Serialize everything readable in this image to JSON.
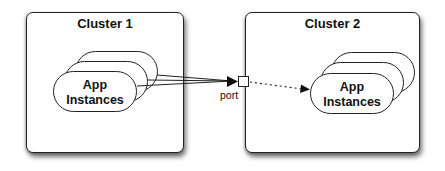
{
  "clusters": [
    {
      "title": "Cluster 1",
      "app_instances": {
        "line1": "App",
        "line2": "Instances",
        "stack_count": 3
      }
    },
    {
      "title": "Cluster 2",
      "app_instances": {
        "line1": "App",
        "line2": "Instances",
        "stack_count": 3
      }
    }
  ],
  "port": {
    "label": "port"
  },
  "connections": [
    {
      "from": "Cluster 1 App Instances",
      "to": "port",
      "style": "solid",
      "count": 3
    },
    {
      "from": "port",
      "to": "Cluster 2 App Instances",
      "style": "dotted",
      "count": 1
    }
  ],
  "colors": {
    "stroke": "#222222",
    "background": "#ffffff",
    "text": "#111111"
  }
}
